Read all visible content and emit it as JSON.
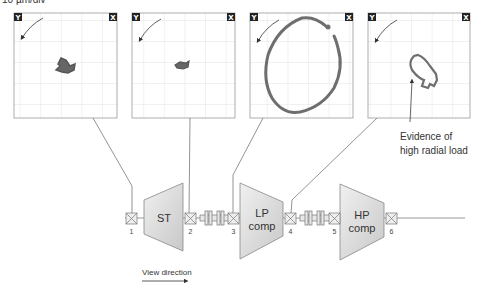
{
  "scale_label": "10 µm/div",
  "plots": [
    {
      "id": 1,
      "y_label": "Y",
      "x_label": "X",
      "orbit": "small-tight"
    },
    {
      "id": 2,
      "y_label": "Y",
      "x_label": "X",
      "orbit": "small-tight"
    },
    {
      "id": 3,
      "y_label": "Y",
      "x_label": "X",
      "orbit": "large-elliptical"
    },
    {
      "id": 4,
      "y_label": "Y",
      "x_label": "X",
      "orbit": "medium-elliptical-flattened"
    }
  ],
  "annotation": {
    "line1": "Evidence of",
    "line2": "high radial load"
  },
  "machines": [
    {
      "id": "st",
      "label_line1": "ST",
      "label_line2": ""
    },
    {
      "id": "lp",
      "label_line1": "LP",
      "label_line2": "comp"
    },
    {
      "id": "hp",
      "label_line1": "HP",
      "label_line2": "comp"
    }
  ],
  "bearings": [
    "1",
    "2",
    "3",
    "4",
    "5",
    "6"
  ],
  "view_direction": "View direction",
  "colors": {
    "orbit": "#6e6e6e",
    "grid": "#d9d9d9",
    "box": "#9a9a9a",
    "machine_fill": "#d8d8d8",
    "label_bg": "#222222"
  }
}
